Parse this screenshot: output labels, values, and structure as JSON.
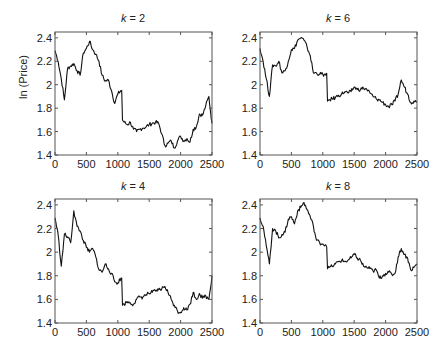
{
  "chart_data": [
    {
      "type": "line",
      "title": "k = 2",
      "title_var": "k",
      "title_value": "2",
      "xlabel": "",
      "ylabel": "ln (Price)",
      "xlim": [
        0,
        2500
      ],
      "ylim": [
        1.4,
        2.45
      ],
      "xticks": [
        0,
        500,
        1000,
        1500,
        2000,
        2500
      ],
      "yticks": [
        1.4,
        1.6,
        1.8,
        2,
        2.2,
        2.4
      ],
      "grid": false,
      "x": [
        0,
        50,
        100,
        150,
        200,
        250,
        300,
        350,
        400,
        450,
        500,
        550,
        600,
        650,
        700,
        750,
        800,
        850,
        900,
        950,
        1000,
        1050,
        1075,
        1100,
        1150,
        1200,
        1250,
        1300,
        1350,
        1400,
        1450,
        1500,
        1550,
        1600,
        1650,
        1700,
        1750,
        1800,
        1850,
        1900,
        1950,
        2000,
        2050,
        2100,
        2150,
        2200,
        2250,
        2300,
        2350,
        2400,
        2450,
        2500
      ],
      "values": [
        2.29,
        2.2,
        2.05,
        1.87,
        2.14,
        2.16,
        2.18,
        2.12,
        2.08,
        2.27,
        2.31,
        2.37,
        2.3,
        2.26,
        2.2,
        2.08,
        2.03,
        2.04,
        1.95,
        1.84,
        1.92,
        1.95,
        1.7,
        1.68,
        1.66,
        1.68,
        1.62,
        1.6,
        1.62,
        1.63,
        1.64,
        1.66,
        1.67,
        1.68,
        1.67,
        1.58,
        1.48,
        1.5,
        1.52,
        1.46,
        1.52,
        1.56,
        1.52,
        1.54,
        1.51,
        1.62,
        1.64,
        1.75,
        1.74,
        1.82,
        1.9,
        1.67
      ]
    },
    {
      "type": "line",
      "title": "k = 6",
      "title_var": "k",
      "title_value": "6",
      "xlabel": "",
      "ylabel": "",
      "xlim": [
        0,
        2500
      ],
      "ylim": [
        1.4,
        2.45
      ],
      "xticks": [
        0,
        500,
        1000,
        1500,
        2000,
        2500
      ],
      "yticks": [
        1.4,
        1.6,
        1.8,
        2,
        2.2,
        2.4
      ],
      "grid": false,
      "x": [
        0,
        50,
        100,
        150,
        200,
        250,
        300,
        350,
        400,
        450,
        500,
        550,
        600,
        650,
        700,
        750,
        800,
        850,
        900,
        950,
        1000,
        1050,
        1075,
        1100,
        1150,
        1200,
        1250,
        1300,
        1350,
        1400,
        1450,
        1500,
        1550,
        1600,
        1650,
        1700,
        1750,
        1800,
        1850,
        1900,
        1950,
        2000,
        2050,
        2100,
        2150,
        2200,
        2250,
        2300,
        2350,
        2400,
        2450,
        2500
      ],
      "values": [
        2.31,
        2.2,
        2.05,
        1.9,
        2.17,
        2.16,
        2.2,
        2.1,
        2.12,
        2.2,
        2.3,
        2.31,
        2.38,
        2.4,
        2.38,
        2.32,
        2.25,
        2.1,
        2.1,
        2.09,
        2.09,
        2.08,
        1.86,
        1.87,
        1.88,
        1.89,
        1.91,
        1.92,
        1.94,
        1.93,
        1.94,
        1.98,
        1.96,
        1.96,
        1.97,
        1.96,
        1.93,
        1.9,
        1.88,
        1.87,
        1.85,
        1.83,
        1.81,
        1.83,
        1.86,
        1.92,
        2.04,
        1.98,
        1.92,
        1.85,
        1.86,
        1.85
      ]
    },
    {
      "type": "line",
      "title": "k = 4",
      "title_var": "k",
      "title_value": "4",
      "xlabel": "",
      "ylabel": "",
      "xlim": [
        0,
        2500
      ],
      "ylim": [
        1.4,
        2.45
      ],
      "xticks": [
        0,
        500,
        1000,
        1500,
        2000,
        2500
      ],
      "yticks": [
        1.4,
        1.6,
        1.8,
        2,
        2.2,
        2.4
      ],
      "grid": false,
      "x": [
        0,
        50,
        100,
        150,
        200,
        250,
        300,
        350,
        400,
        450,
        500,
        550,
        600,
        650,
        700,
        750,
        800,
        850,
        900,
        950,
        1000,
        1050,
        1075,
        1100,
        1150,
        1200,
        1250,
        1300,
        1350,
        1400,
        1450,
        1500,
        1550,
        1600,
        1650,
        1700,
        1750,
        1800,
        1850,
        1900,
        1950,
        2000,
        2050,
        2100,
        2150,
        2200,
        2250,
        2300,
        2350,
        2400,
        2450,
        2500
      ],
      "values": [
        2.29,
        2.15,
        1.88,
        2.15,
        2.13,
        2.08,
        2.35,
        2.22,
        2.18,
        2.1,
        2.04,
        2.0,
        2.03,
        1.96,
        1.85,
        1.83,
        1.9,
        1.86,
        1.82,
        1.75,
        1.74,
        1.78,
        1.55,
        1.56,
        1.58,
        1.57,
        1.56,
        1.6,
        1.62,
        1.62,
        1.64,
        1.65,
        1.66,
        1.67,
        1.68,
        1.69,
        1.71,
        1.66,
        1.6,
        1.55,
        1.5,
        1.49,
        1.53,
        1.51,
        1.56,
        1.66,
        1.6,
        1.65,
        1.61,
        1.63,
        1.6,
        1.8
      ]
    },
    {
      "type": "line",
      "title": "k = 8",
      "title_var": "k",
      "title_value": "8",
      "xlabel": "",
      "ylabel": "",
      "xlim": [
        0,
        2500
      ],
      "ylim": [
        1.4,
        2.45
      ],
      "xticks": [
        0,
        500,
        1000,
        1500,
        2000,
        2500
      ],
      "yticks": [
        1.4,
        1.6,
        1.8,
        2,
        2.2,
        2.4
      ],
      "grid": false,
      "x": [
        0,
        50,
        100,
        150,
        200,
        250,
        300,
        350,
        400,
        450,
        500,
        550,
        600,
        650,
        700,
        750,
        800,
        850,
        900,
        950,
        1000,
        1050,
        1075,
        1100,
        1150,
        1200,
        1250,
        1300,
        1350,
        1400,
        1450,
        1500,
        1550,
        1600,
        1650,
        1700,
        1750,
        1800,
        1850,
        1900,
        1950,
        2000,
        2050,
        2100,
        2150,
        2200,
        2250,
        2300,
        2350,
        2400,
        2450,
        2500
      ],
      "values": [
        2.29,
        2.22,
        2.05,
        1.9,
        2.2,
        2.18,
        2.12,
        2.15,
        2.17,
        2.28,
        2.3,
        2.24,
        2.35,
        2.38,
        2.42,
        2.36,
        2.3,
        2.22,
        2.1,
        2.08,
        2.07,
        2.06,
        1.86,
        1.87,
        1.88,
        1.9,
        1.92,
        1.93,
        1.92,
        1.93,
        1.95,
        1.98,
        1.95,
        1.93,
        1.88,
        1.87,
        1.86,
        1.84,
        1.85,
        1.78,
        1.8,
        1.82,
        1.83,
        1.81,
        1.82,
        1.96,
        2.03,
        1.98,
        1.95,
        1.85,
        1.87,
        1.9
      ]
    }
  ],
  "figure": {
    "shared_ylabel": "ln (Price)",
    "line_color": "#111111",
    "frame_color": "#555555",
    "background": "#ffffff"
  }
}
